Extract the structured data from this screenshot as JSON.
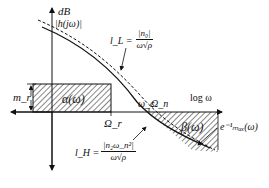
{
  "diagram": {
    "type": "loop-shaping bode magnitude bounds",
    "axes": {
      "y_label_top": "dB",
      "y_label_bottom": "|h(jω)|",
      "x_label": "log ω"
    },
    "regions": {
      "alpha": "α(ω)",
      "beta": "β(ω)"
    },
    "markers": {
      "m_r": "m_r",
      "omega_r": "Ω_r",
      "omega_c": "ω_c",
      "omega_n": "Ω_n"
    },
    "bounds": {
      "l_L": {
        "lhs": "l_L =",
        "num": "|n₀|",
        "den": "ω√ρ"
      },
      "l_H": {
        "lhs": "l_H =",
        "num": "|n₂ω_n²|",
        "den": "ω√ρ"
      },
      "e_max": "e⁻¹ₘₐₓ(ω)"
    },
    "colors": {
      "ink": "#111111",
      "background": "#ffffff"
    }
  }
}
